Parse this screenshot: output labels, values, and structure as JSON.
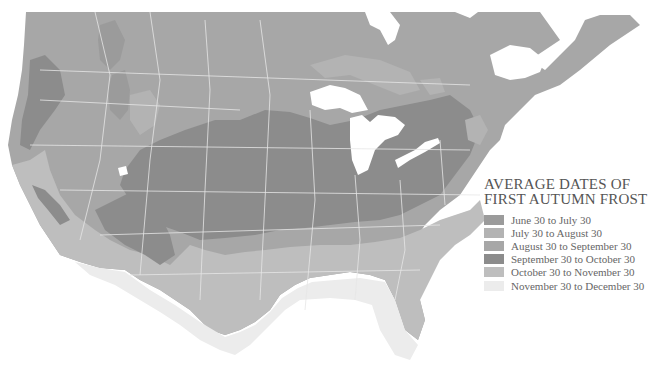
{
  "map": {
    "region": "United States and Southern Canada",
    "colors": {
      "background": "#ffffff",
      "water": "#ffffff",
      "borders": "#e8e8e8",
      "zone_1": "#9b9b9b",
      "zone_2": "#b3b3b3",
      "zone_3": "#a7a7a7",
      "zone_4": "#8c8c8c",
      "zone_5": "#bebebe",
      "zone_6": "#ececec"
    }
  },
  "legend": {
    "title_line1": "AVERAGE DATES OF",
    "title_line2": "FIRST AUTUMN FROST",
    "items": [
      {
        "label": "June 30 to July 30",
        "color": "#9b9b9b"
      },
      {
        "label": "July 30 to August 30",
        "color": "#b3b3b3"
      },
      {
        "label": "August 30 to September 30",
        "color": "#a7a7a7"
      },
      {
        "label": "September 30 to October 30",
        "color": "#8c8c8c"
      },
      {
        "label": "October 30 to November 30",
        "color": "#bebebe"
      },
      {
        "label": "November 30 to December 30",
        "color": "#ececec"
      }
    ]
  }
}
